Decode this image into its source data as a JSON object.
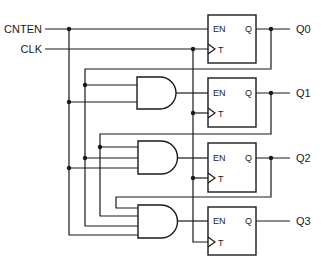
{
  "diagram": {
    "inputs": [
      {
        "label": "CNTEN"
      },
      {
        "label": "CLK"
      }
    ],
    "outputs": [
      {
        "label": "Q0"
      },
      {
        "label": "Q1"
      },
      {
        "label": "Q2"
      },
      {
        "label": "Q3"
      }
    ],
    "flipflops": [
      {
        "en_label": "EN",
        "clk_label": "T",
        "q_label": "Q"
      },
      {
        "en_label": "EN",
        "clk_label": "T",
        "q_label": "Q"
      },
      {
        "en_label": "EN",
        "clk_label": "T",
        "q_label": "Q"
      },
      {
        "en_label": "EN",
        "clk_label": "T",
        "q_label": "Q"
      }
    ],
    "gates": [
      {
        "type": "AND",
        "inputs": [
          "CNTEN",
          "Q0"
        ],
        "drives": "FF1.EN"
      },
      {
        "type": "AND",
        "inputs": [
          "CNTEN",
          "Q0",
          "Q1"
        ],
        "drives": "FF2.EN"
      },
      {
        "type": "AND",
        "inputs": [
          "CNTEN",
          "Q0",
          "Q1",
          "Q2"
        ],
        "drives": "FF3.EN"
      }
    ],
    "colors": {
      "line": "#1a1a1a",
      "background": "#ffffff"
    }
  }
}
